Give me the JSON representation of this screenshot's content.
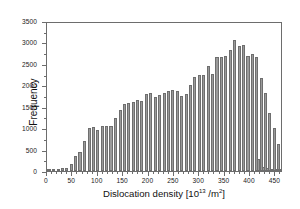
{
  "chart_data": {
    "type": "bar",
    "title": "",
    "subtitle": "",
    "xlabel_text": "Dislocation density [10",
    "xlabel_exponent": "13",
    "xlabel_unit": " /m",
    "xlabel_unit_exponent": "2",
    "xlabel_close": "]",
    "xlabel": "Dislocation density [10^13 /m^2]",
    "ylabel": "Frequency",
    "xlim": [
      0,
      465
    ],
    "ylim": [
      0,
      3500
    ],
    "grid": false,
    "legend": "none",
    "x_ticks": [
      0,
      50,
      100,
      150,
      200,
      250,
      300,
      350,
      400,
      450
    ],
    "x_minor_step": 10,
    "y_ticks": [
      0,
      500,
      1000,
      1500,
      2000,
      2500,
      3000,
      3500
    ],
    "y_minor_step": 250,
    "bin_width": 8.7,
    "bin_centers": [
      4,
      13,
      22,
      30,
      39,
      48,
      57,
      65,
      74,
      83,
      91,
      100,
      109,
      117,
      126,
      135,
      144,
      152,
      161,
      170,
      178,
      187,
      196,
      204,
      213,
      222,
      231,
      239,
      248,
      257,
      265,
      274,
      283,
      291,
      300,
      309,
      318,
      326,
      335,
      344,
      352,
      361,
      370,
      379,
      387,
      396,
      405,
      413,
      422,
      431,
      439,
      448,
      457
    ],
    "values": [
      10,
      15,
      25,
      60,
      80,
      160,
      340,
      450,
      700,
      1010,
      1020,
      960,
      1050,
      1040,
      1040,
      1230,
      1430,
      1570,
      1580,
      1610,
      1650,
      1640,
      1800,
      1810,
      1720,
      1780,
      1830,
      1860,
      1880,
      1870,
      1760,
      1800,
      2000,
      2200,
      2230,
      2240,
      2450,
      2270,
      2670,
      2670,
      2680,
      2830,
      3050,
      2920,
      2930,
      2690,
      2740,
      2670,
      2180,
      1830,
      1350,
      1000,
      640
    ],
    "tail_values": [
      270,
      90,
      60,
      40,
      30,
      20
    ],
    "tail_centers": [
      417,
      426,
      435,
      443,
      452,
      459
    ],
    "series_name": "Frequency distribution",
    "bar_color": "#9a9a9a",
    "bar_edge_color": "#6e6e6e",
    "axis_color": "#6d6d6d",
    "text_color": "#1a1a1a",
    "background": "#ffffff",
    "peak_value": 3050,
    "peak_x": 318
  }
}
